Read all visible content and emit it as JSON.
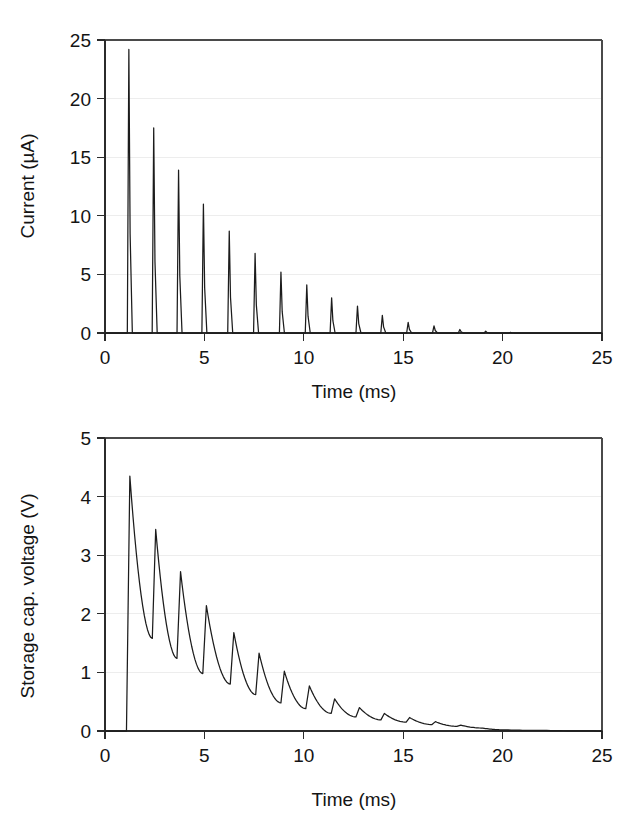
{
  "figure": {
    "background": "#ffffff",
    "trace_color": "#1c1c1c",
    "axis_color": "#2b2b2b",
    "grid_color": "#e8e8e8"
  },
  "chart_data": [
    {
      "id": "current-vs-time",
      "type": "line",
      "title": "",
      "xlabel": "Time (ms)",
      "ylabel": "Current (µA)",
      "xlim": [
        0,
        25
      ],
      "ylim": [
        0,
        25
      ],
      "xticks": [
        0,
        5,
        10,
        15,
        20,
        25
      ],
      "xtick_labels": [
        "0",
        "5",
        "10",
        "15",
        "20",
        "25"
      ],
      "yticks": [
        0,
        5,
        10,
        15,
        20,
        25
      ],
      "ytick_labels": [
        "0",
        "5",
        "10",
        "15",
        "20",
        "25"
      ],
      "grid": "horizontal-faint",
      "legend": "none",
      "description": "Train of narrow current spikes decaying exponentially; baseline at 0 before 1.1 ms and after ~20 ms.",
      "series": [
        {
          "name": "Current",
          "units": "µA",
          "spike_times_ms": [
            1.2,
            2.45,
            3.7,
            4.95,
            6.25,
            7.55,
            8.85,
            10.15,
            11.4,
            12.7,
            13.95,
            15.25,
            16.55,
            17.85,
            19.15,
            20.4
          ],
          "spike_peaks_uA": [
            24.2,
            17.5,
            13.9,
            11.0,
            8.7,
            6.8,
            5.2,
            4.1,
            3.0,
            2.3,
            1.5,
            0.9,
            0.6,
            0.3,
            0.15,
            0.05
          ],
          "spike_half_width_ms": 0.14,
          "baseline_uA": 0
        }
      ]
    },
    {
      "id": "storage-cap-voltage-vs-time",
      "type": "line",
      "title": "",
      "xlabel": "Time (ms)",
      "ylabel": "Storage cap. voltage (V)",
      "xlim": [
        0,
        25
      ],
      "ylim": [
        0,
        5
      ],
      "xticks": [
        0,
        5,
        10,
        15,
        20,
        25
      ],
      "xtick_labels": [
        "0",
        "5",
        "10",
        "15",
        "20",
        "25"
      ],
      "yticks": [
        0,
        1,
        2,
        3,
        4,
        5
      ],
      "ytick_labels": [
        "0",
        "1",
        "2",
        "3",
        "4",
        "5"
      ],
      "grid": "horizontal-faint",
      "legend": "none",
      "description": "Sawtooth-like capacitor voltage: sharp rise to 4.35 V at 1.25 ms, then repeated exponential discharges with partial recharges of decreasing amplitude, settling to 0 V by ~20 ms.",
      "series": [
        {
          "name": "Storage cap. voltage",
          "units": "V",
          "nodes_t_ms": [
            0.0,
            1.08,
            1.25,
            2.38,
            2.55,
            3.62,
            3.8,
            4.92,
            5.1,
            6.3,
            6.48,
            7.58,
            7.75,
            8.85,
            9.02,
            10.1,
            10.28,
            11.38,
            11.55,
            12.62,
            12.8,
            13.88,
            14.05,
            15.15,
            15.32,
            16.45,
            16.62,
            17.7,
            17.9,
            19.0,
            20.0,
            22.0,
            25.0
          ],
          "nodes_v": [
            0.0,
            0.0,
            4.35,
            1.58,
            3.44,
            1.24,
            2.72,
            0.98,
            2.14,
            0.8,
            1.68,
            0.62,
            1.33,
            0.48,
            1.02,
            0.38,
            0.77,
            0.3,
            0.55,
            0.24,
            0.4,
            0.19,
            0.3,
            0.15,
            0.23,
            0.11,
            0.16,
            0.08,
            0.1,
            0.05,
            0.02,
            0.01,
            0.0
          ],
          "peaks_v": [
            4.35,
            3.44,
            2.72,
            2.14,
            1.68,
            1.33,
            1.02,
            0.77,
            0.55,
            0.4,
            0.3,
            0.23,
            0.16,
            0.1
          ],
          "valleys_v": [
            1.58,
            1.24,
            0.98,
            0.8,
            0.62,
            0.48,
            0.38,
            0.3,
            0.24,
            0.19,
            0.15,
            0.11,
            0.08,
            0.05
          ]
        }
      ]
    }
  ]
}
